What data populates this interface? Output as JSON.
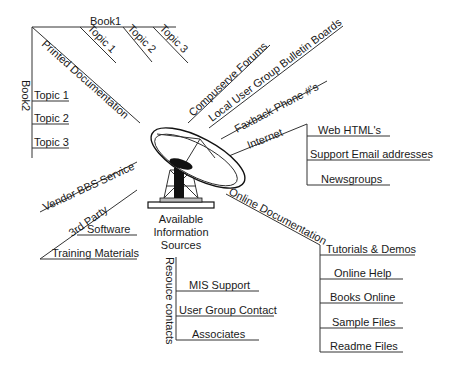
{
  "center": {
    "label_lines": [
      "Available",
      "Information",
      "Sources"
    ],
    "icon": "satellite-dish-icon"
  },
  "branches": {
    "printed_documentation": {
      "label": "Printed Documentation",
      "book1": {
        "label": "Book1",
        "topics": [
          "Topic 1",
          "Topic 2",
          "Topic 3"
        ]
      },
      "book2": {
        "label": "Book2",
        "topics": [
          "Topic 1",
          "Topic 2",
          "Topic 3"
        ]
      }
    },
    "compuserve_forums": {
      "label": "Compuserve Forums"
    },
    "local_user_group": {
      "label": "Local User Group Bulletin Boards"
    },
    "faxback": {
      "label": "Faxback Phone #'s"
    },
    "internet": {
      "label": "Internet",
      "children": [
        "Web HTML's",
        "Support Email addresses",
        "Newsgroups"
      ]
    },
    "vendor_bbs": {
      "label": "Vendor BBS Service"
    },
    "third_party": {
      "label": "3rd Party",
      "children": [
        "Software",
        "Training Materials"
      ]
    },
    "online_documentation": {
      "label": "Online Documentation",
      "children": [
        "Tutorials & Demos",
        "Online Help",
        "Books Online",
        "Sample Files",
        "Readme Files"
      ]
    },
    "resource_contacts": {
      "label": "Resouce contacts",
      "children": [
        "MIS Support",
        "User Group Contact",
        "Associates"
      ]
    }
  }
}
